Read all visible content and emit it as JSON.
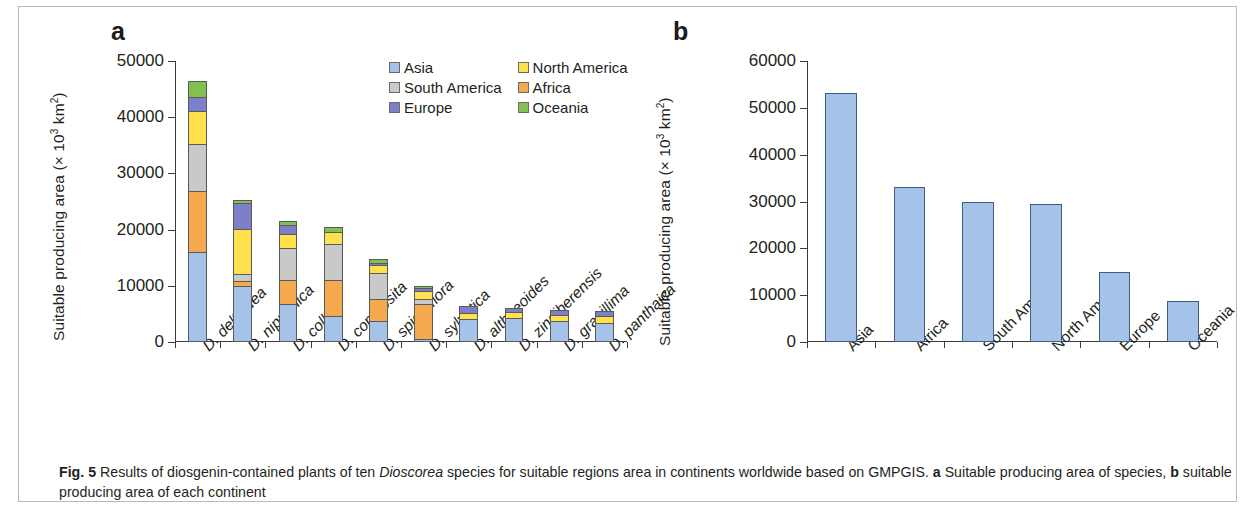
{
  "figure": {
    "caption_label": "Fig. 5",
    "caption_text_1": " Results of diosgenin-contained plants of ten ",
    "caption_italic": "Dioscorea",
    "caption_text_2": " species for suitable regions area in continents worldwide based on GMPGIS. ",
    "caption_bold_a": "a",
    "caption_text_3": " Suitable producing area of species, ",
    "caption_bold_b": "b",
    "caption_text_4": " suitable producing area of each continent"
  },
  "panel_a": {
    "letter": "a",
    "axis_title_prefix": "Suitable producing area (× 10",
    "axis_title_sup": "3",
    "axis_title_suffix": " km",
    "axis_title_sup2": "2",
    "axis_title_end": ")"
  },
  "panel_b": {
    "letter": "b",
    "axis_title_prefix": "Suitable producing area (× 10",
    "axis_title_sup": "3",
    "axis_title_suffix": " km",
    "axis_title_sup2": "2",
    "axis_title_end": ")"
  },
  "colors": {
    "asia": "#a5c2e8",
    "africa": "#f5a94e",
    "south_america": "#c9c9c9",
    "north_america": "#ffe14d",
    "europe": "#7d80c8",
    "oceania": "#82c050",
    "bar_outline": "#5a5a5a",
    "panel_b_bar": "#a5c2e8",
    "panel_b_outline": "#3f5d80",
    "axis": "#3b3b3b",
    "frame": "#b9b9b9"
  },
  "chart_data": [
    {
      "type": "bar",
      "id": "panel-a",
      "title": "",
      "subtitle": "a Suitable producing area of species",
      "stacked": true,
      "xlabel": "",
      "ylabel": "Suitable producing area (× 10^3 km^2)",
      "ylim": [
        0,
        50000
      ],
      "yticks": [
        0,
        10000,
        20000,
        30000,
        40000,
        50000
      ],
      "ytick_labels": [
        "0",
        "10000",
        "20000",
        "30000",
        "40000",
        "50000"
      ],
      "grid": false,
      "legend_position": "top-right",
      "categories": [
        "D. deltoidea",
        "D. nipponica",
        "D. colletti",
        "D. composita",
        "D. spiculiflora",
        "D. sylvatica",
        "D. althaeoides",
        "D. zingiberensis",
        "D. gracillima",
        "D. panthaica"
      ],
      "series": [
        {
          "name": "Asia",
          "color": "#a5c2e8",
          "values": [
            16100,
            9900,
            6700,
            4700,
            3700,
            600,
            4100,
            4300,
            3700,
            3400
          ]
        },
        {
          "name": "Africa",
          "color": "#f5a94e",
          "values": [
            10900,
            1200,
            4500,
            6600,
            4200,
            6300,
            0,
            0,
            0,
            0
          ]
        },
        {
          "name": "South America",
          "color": "#c9c9c9",
          "values": [
            8600,
            1400,
            5800,
            6500,
            4800,
            1100,
            0,
            0,
            0,
            0
          ]
        },
        {
          "name": "North America",
          "color": "#ffe14d",
          "values": [
            6100,
            8200,
            2800,
            2300,
            1600,
            1600,
            1300,
            1300,
            1300,
            1400
          ]
        },
        {
          "name": "Europe",
          "color": "#7d80c8",
          "values": [
            2700,
            4800,
            1700,
            0,
            400,
            700,
            1300,
            900,
            1000,
            1000
          ]
        },
        {
          "name": "Oceania",
          "color": "#82c050",
          "values": [
            2900,
            700,
            900,
            1000,
            900,
            600,
            0,
            0,
            0,
            0
          ]
        }
      ],
      "totals": [
        47300,
        26200,
        22400,
        21100,
        15600,
        10900,
        6700,
        6500,
        6000,
        5800
      ]
    },
    {
      "type": "bar",
      "id": "panel-b",
      "title": "",
      "subtitle": "b suitable producing area of each continent",
      "stacked": false,
      "xlabel": "",
      "ylabel": "Suitable producing area (× 10^3 km^2)",
      "ylim": [
        0,
        60000
      ],
      "yticks": [
        0,
        10000,
        20000,
        30000,
        40000,
        50000,
        60000
      ],
      "ytick_labels": [
        "0",
        "10000",
        "20000",
        "30000",
        "40000",
        "50000",
        "60000"
      ],
      "grid": false,
      "categories": [
        "Asia",
        "Africa",
        "South America",
        "North America",
        "Europe",
        "Oceania"
      ],
      "values": [
        53200,
        33000,
        30000,
        29500,
        15000,
        8800
      ],
      "color": "#a5c2e8"
    }
  ]
}
